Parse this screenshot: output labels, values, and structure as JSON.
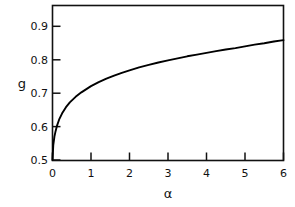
{
  "chart_data": {
    "type": "line",
    "title": "",
    "xlabel": "α",
    "ylabel": "g",
    "xlim": [
      0,
      6
    ],
    "ylim": [
      0.5,
      0.95
    ],
    "grid": false,
    "legend": null,
    "frame": "box",
    "line_color": "#000000",
    "background_color": "#ffffff",
    "xticks": [
      "0",
      "1",
      "2",
      "3",
      "4",
      "5",
      "6"
    ],
    "xtick_values": [
      0,
      1,
      2,
      3,
      4,
      5,
      6
    ],
    "yticks": [
      "0.5",
      "0.6",
      "0.7",
      "0.8",
      "0.9"
    ],
    "ytick_values": [
      0.5,
      0.6,
      0.7,
      0.8,
      0.9
    ],
    "series": [
      {
        "name": "g(α)",
        "x": [
          0,
          0.02,
          0.05,
          0.08,
          0.12,
          0.18,
          0.25,
          0.35,
          0.45,
          0.6,
          0.75,
          0.9,
          1.0,
          1.2,
          1.4,
          1.6,
          1.8,
          2.0,
          2.25,
          2.5,
          2.75,
          3.0,
          3.25,
          3.5,
          3.75,
          4.0,
          4.25,
          4.5,
          4.75,
          5.0,
          5.25,
          5.5,
          5.75,
          6.0
        ],
        "y": [
          0.5,
          0.543,
          0.568,
          0.584,
          0.601,
          0.62,
          0.636,
          0.654,
          0.668,
          0.684,
          0.697,
          0.708,
          0.715,
          0.727,
          0.737,
          0.746,
          0.754,
          0.761,
          0.77,
          0.777,
          0.784,
          0.79,
          0.796,
          0.802,
          0.807,
          0.812,
          0.817,
          0.822,
          0.826,
          0.831,
          0.836,
          0.84,
          0.845,
          0.849
        ]
      }
    ],
    "note": "monotonically increasing concave curve rising steeply from g=0.5 at alpha=0 toward g~0.91 at alpha=6"
  },
  "axes": {
    "y_axis_label": "g",
    "x_axis_label": "α"
  }
}
